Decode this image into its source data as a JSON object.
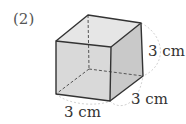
{
  "problem_number": "(2)",
  "figure": {
    "type": "cube",
    "labels": {
      "height": "3 cm",
      "depth": "3 cm",
      "width": "3 cm"
    },
    "colors": {
      "top_face": "#e6e6e6",
      "front_face": "#d9d9d9",
      "right_face": "#c9c9c9",
      "edge": "#333333",
      "hidden_edge": "#555555",
      "dimension_arc": "#cfcfcf"
    }
  }
}
